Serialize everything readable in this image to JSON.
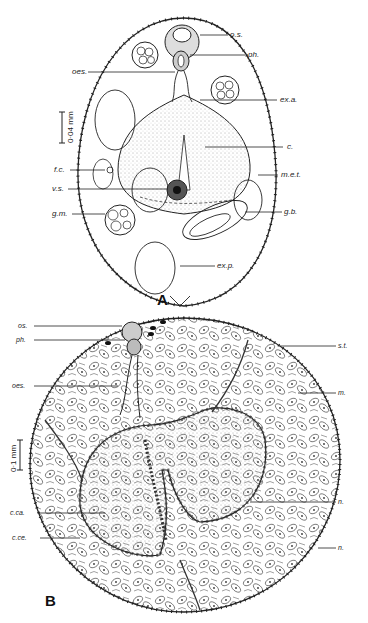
{
  "figure": {
    "panels": [
      {
        "letter": "A",
        "scale_bar": "0·04 mm",
        "labels": {
          "os": "o.s.",
          "ph": "ph.",
          "oes": "oes.",
          "exa": "ex.a.",
          "c": "c.",
          "fc": "f.c.",
          "met": "m.e.t.",
          "vs": "v.s.",
          "gm": "g.m.",
          "gb": "g.b.",
          "exp": "ex.p."
        }
      },
      {
        "letter": "B",
        "scale_bar": "0·1 mm",
        "labels": {
          "os": "os.",
          "ph": "ph.",
          "st": "s.t.",
          "oes": "oes.",
          "m": "m.",
          "n1": "n.",
          "cca": "c.ca.",
          "cce": "c.ce.",
          "n2": "n."
        }
      }
    ]
  }
}
